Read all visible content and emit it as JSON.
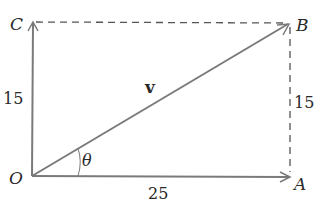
{
  "diagram": {
    "type": "vector-rectangle",
    "points": {
      "O": {
        "label": "O",
        "x": 32,
        "y": 176
      },
      "A": {
        "label": "A",
        "x": 290,
        "y": 177
      },
      "B": {
        "label": "B",
        "x": 290,
        "y": 23
      },
      "C": {
        "label": "C",
        "x": 33,
        "y": 22
      }
    },
    "labels": {
      "vector": "v",
      "angle": "θ",
      "side_OA": "25",
      "side_OC": "15",
      "side_AB": "15"
    },
    "colors": {
      "line": "#7a7a7a",
      "dashed": "#555555",
      "text": "#2a2a2a"
    }
  }
}
